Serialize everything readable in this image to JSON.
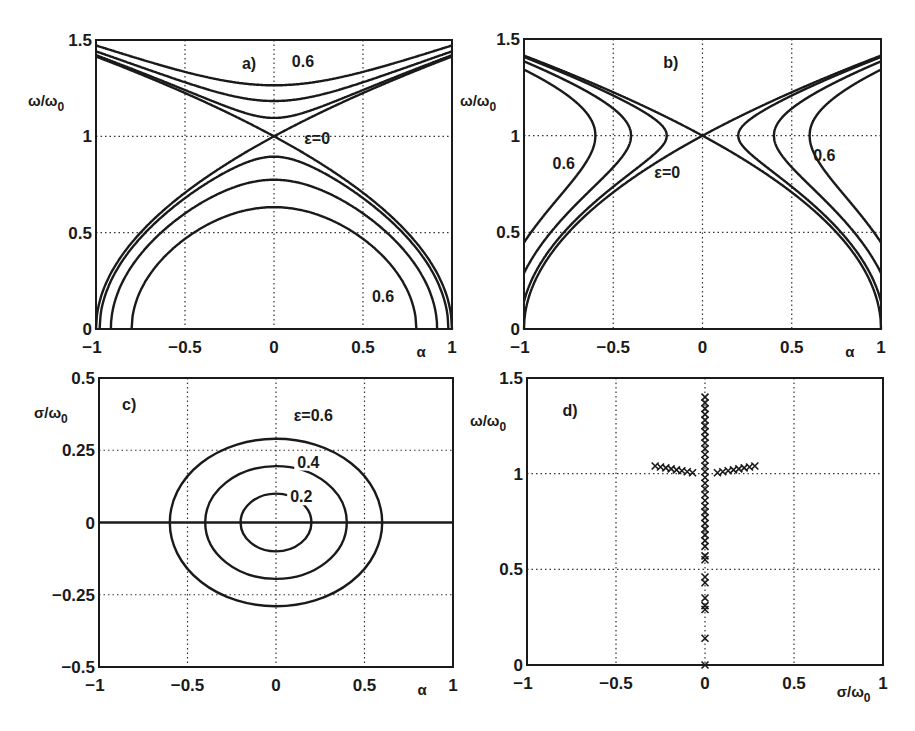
{
  "chart_data": [
    {
      "id": "a",
      "type": "line",
      "panel_label": "a)",
      "title": "",
      "xlabel": "α",
      "ylabel": "ω/ω0",
      "xlim": [
        -1,
        1
      ],
      "ylim": [
        0,
        1.5
      ],
      "xticks": [
        "−1",
        "−0.5",
        "0",
        "0.5",
        "1"
      ],
      "yticks": [
        "0",
        "0.5",
        "1",
        "1.5"
      ],
      "grid": true,
      "relation": "(ω/ω0)^2 = 1 ± sqrt(α^2 + ε^2)",
      "series_params": [
        0,
        0.2,
        0.4,
        0.6
      ],
      "key_points": {
        "eps_0.6": {
          "upper_at_alpha0": 1.265,
          "lower_at_alpha0": 0.632,
          "lower_zero_alpha": 0.8
        },
        "eps_0.4": {
          "upper_at_alpha0": 1.183,
          "lower_at_alpha0": 0.775,
          "lower_zero_alpha": 0.917
        },
        "eps_0.2": {
          "upper_at_alpha0": 1.095,
          "lower_at_alpha0": 0.894,
          "lower_zero_alpha": 0.98
        },
        "eps_0": {
          "crossing": [
            0,
            1
          ],
          "upper_at_alpha1": 1.414,
          "lower_zero_alpha": 1.0
        }
      },
      "annotations": [
        {
          "text": "0.6",
          "x": 0.1,
          "y": 1.36
        },
        {
          "text": "ε=0",
          "x": 0.17,
          "y": 0.96
        },
        {
          "text": "0.6",
          "x": 0.55,
          "y": 0.14
        }
      ]
    },
    {
      "id": "b",
      "type": "line",
      "panel_label": "b)",
      "xlabel": "α",
      "ylabel": "ω/ω0",
      "xlim": [
        -1,
        1
      ],
      "ylim": [
        0,
        1.5
      ],
      "xticks": [
        "−1",
        "−0.5",
        "0",
        "0.5",
        "1"
      ],
      "yticks": [
        "0",
        "0.5",
        "1",
        "1.5"
      ],
      "grid": true,
      "relation": "(ω/ω0)^2 = 1 ± sqrt(α^2 − ε^2), |α| ≥ ε",
      "series_params": [
        0,
        0.2,
        0.4,
        0.6
      ],
      "key_points": {
        "eps_0.6": {
          "vertex_alpha": 0.6,
          "at_alpha1": [
            1.342,
            0.447
          ]
        },
        "eps_0.4": {
          "vertex_alpha": 0.4,
          "at_alpha1": [
            1.385,
            0.293
          ]
        },
        "eps_0.2": {
          "vertex_alpha": 0.2,
          "at_alpha1": [
            1.407,
            0.14
          ]
        },
        "eps_0": {
          "crossing": [
            0,
            1
          ]
        }
      },
      "annotations": [
        {
          "text": "0.6",
          "x": -0.84,
          "y": 0.83
        },
        {
          "text": "ε=0",
          "x": -0.27,
          "y": 0.78
        },
        {
          "text": "0.6",
          "x": 0.62,
          "y": 0.87
        }
      ]
    },
    {
      "id": "c",
      "type": "line",
      "panel_label": "c)",
      "xlabel": "α",
      "ylabel": "σ/ω0",
      "xlim": [
        -1,
        1
      ],
      "ylim": [
        -0.5,
        0.5
      ],
      "xticks": [
        "−1",
        "−0.5",
        "0",
        "0.5",
        "1"
      ],
      "yticks": [
        "−0.5",
        "−0.25",
        "0",
        "0.25",
        "0.5"
      ],
      "grid": true,
      "relation": "σ/ω0 = ± sqrt(ε^2 − α^2)/2 (ellipses), plus σ=0 line",
      "series": [
        {
          "name": "ε=0.6",
          "alpha_half_width": 0.6,
          "sigma_half_height": 0.29
        },
        {
          "name": "0.4",
          "alpha_half_width": 0.4,
          "sigma_half_height": 0.195
        },
        {
          "name": "0.2",
          "alpha_half_width": 0.2,
          "sigma_half_height": 0.1
        },
        {
          "name": "σ=0",
          "y": 0
        }
      ],
      "annotations": [
        {
          "text": "ε=0.6",
          "x": 0.1,
          "y": 0.35
        },
        {
          "text": "0.4",
          "x": 0.12,
          "y": 0.19
        },
        {
          "text": "0.2",
          "x": 0.08,
          "y": 0.07
        }
      ]
    },
    {
      "id": "d",
      "type": "scatter",
      "panel_label": "d)",
      "xlabel": "σ/ω0",
      "ylabel": "ω/ω0",
      "xlim": [
        -1,
        1
      ],
      "ylim": [
        0,
        1.5
      ],
      "xticks": [
        "−1",
        "−0.5",
        "0",
        "0.5",
        "1"
      ],
      "yticks": [
        "0",
        "0.5",
        "1",
        "1.5"
      ],
      "grid": true,
      "marker": "x",
      "series": [
        {
          "name": "vertical branch",
          "x": 0,
          "y": [
            0,
            0.14,
            0.29,
            0.31,
            0.35,
            0.43,
            0.46,
            0.55,
            0.57,
            0.62,
            0.65,
            0.68,
            0.71,
            0.74,
            0.77,
            0.8,
            0.83,
            0.86,
            0.89,
            0.92,
            0.95,
            0.98,
            1.01,
            1.04,
            1.07,
            1.1,
            1.13,
            1.16,
            1.19,
            1.22,
            1.25,
            1.28,
            1.31,
            1.34,
            1.37,
            1.4
          ]
        },
        {
          "name": "left branch",
          "x": [
            -0.28,
            -0.25,
            -0.22,
            -0.19,
            -0.16,
            -0.13,
            -0.1,
            -0.07
          ],
          "y": [
            1.04,
            1.035,
            1.03,
            1.025,
            1.02,
            1.015,
            1.01,
            1.005
          ]
        },
        {
          "name": "right branch",
          "x": [
            0.07,
            0.1,
            0.13,
            0.16,
            0.19,
            0.22,
            0.25,
            0.28
          ],
          "y": [
            1.005,
            1.01,
            1.015,
            1.02,
            1.025,
            1.03,
            1.035,
            1.04
          ]
        }
      ]
    }
  ],
  "panels": {
    "a": {
      "label": "a)",
      "ylabel": "ω/ω",
      "ylabel_sub": "0",
      "xlabel": "α",
      "ann1": "0.6",
      "ann2": "ε=0",
      "ann3": "0.6"
    },
    "b": {
      "label": "b)",
      "ylabel": "ω/ω",
      "ylabel_sub": "0",
      "xlabel": "α",
      "ann1": "0.6",
      "ann2": "ε=0",
      "ann3": "0.6"
    },
    "c": {
      "label": "c)",
      "ylabel": "σ/ω",
      "ylabel_sub": "0",
      "xlabel": "α",
      "ann1": "ε=0.6",
      "ann2": "0.4",
      "ann3": "0.2"
    },
    "d": {
      "label": "d)",
      "ylabel": "ω/ω",
      "ylabel_sub": "0",
      "xlabel": "σ/ω",
      "xlabel_sub": "0"
    }
  }
}
